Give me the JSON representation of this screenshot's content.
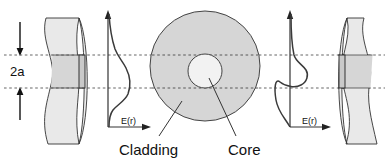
{
  "figure": {
    "background_color": "#ffffff",
    "line_color": "#222222",
    "cladding_color": "#d6d6d6",
    "core_color": "#f2f2f2",
    "fiber_body_color": "#e9e9e9",
    "fiber_core_band_color": "#d6d6d6",
    "dotted_line_color": "#555555"
  },
  "labels": {
    "dimension": "2a",
    "cladding": "Cladding",
    "core": "Core",
    "e_axis_left": "E(r)",
    "e_axis_right": "E(r)"
  },
  "geometry": {
    "core_top_y": 55,
    "core_bottom_y": 88,
    "circle_center_x": 205,
    "circle_center_y": 66,
    "cladding_radius": 55,
    "core_radius": 17
  },
  "curves": {
    "left_profile_description": "broad single-lobe mode field amplitude E(r) vs r, wide relative to core",
    "right_profile_description": "narrow sharply peaked mode field amplitude E(r) vs r, confined near core"
  }
}
